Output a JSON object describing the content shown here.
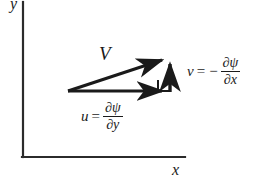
{
  "figure": {
    "background_color": "#ffffff",
    "stroke_color": "#1a1a1a",
    "width": 263,
    "height": 191
  },
  "axes": {
    "y_label": "y",
    "x_label": "x",
    "origin": {
      "x": 23,
      "y": 157
    },
    "x_axis_end": {
      "x": 185,
      "y": 157
    },
    "y_axis_top": {
      "x": 23,
      "y": 2
    }
  },
  "vectors": {
    "resultant": {
      "label": "V",
      "name": "velocity-vector",
      "start": {
        "x": 68,
        "y": 91
      },
      "end": {
        "x": 170,
        "y": 57
      }
    },
    "horizontal": {
      "name": "u-component-vector",
      "start": {
        "x": 68,
        "y": 91
      },
      "end": {
        "x": 170,
        "y": 91
      }
    },
    "vertical": {
      "name": "v-component-vector",
      "start": {
        "x": 170,
        "y": 91
      },
      "end": {
        "x": 170,
        "y": 57
      }
    }
  },
  "right_angle_marker": {
    "name": "right-angle-marker",
    "x": 158,
    "y": 79,
    "size": 12
  },
  "equations": {
    "v_component": {
      "lhs": "v",
      "operator": "=",
      "sign": "−",
      "numerator": "∂ψ",
      "denominator": "∂x"
    },
    "u_component": {
      "lhs": "u",
      "operator": "=",
      "sign": "",
      "numerator": "∂ψ",
      "denominator": "∂y"
    }
  }
}
